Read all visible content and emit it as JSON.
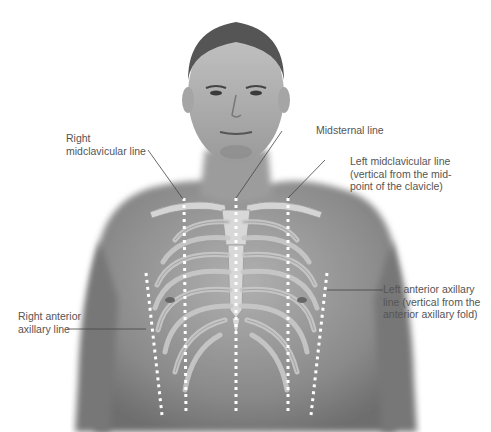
{
  "diagram": {
    "labels": {
      "right_midclavicular": [
        "Right",
        "midclavicular line"
      ],
      "midsternal": [
        "Midsternal line"
      ],
      "left_midclavicular": [
        "Left midclavicular line",
        "(vertical from the mid-",
        "point of the clavicle)"
      ],
      "right_anterior_axillary": [
        "Right anterior",
        "axillary line"
      ],
      "left_anterior_axillary": [
        "Left anterior axillary",
        "line (vertical from the",
        "anterior axillary fold)"
      ]
    },
    "colors": {
      "label_text": "#555555",
      "leader_line": "#444444",
      "dotted_line": "#ffffff",
      "skin_dark": "#7a7a7a",
      "skin_light": "#b5b5b5",
      "bone": "#d0d0d0"
    }
  }
}
